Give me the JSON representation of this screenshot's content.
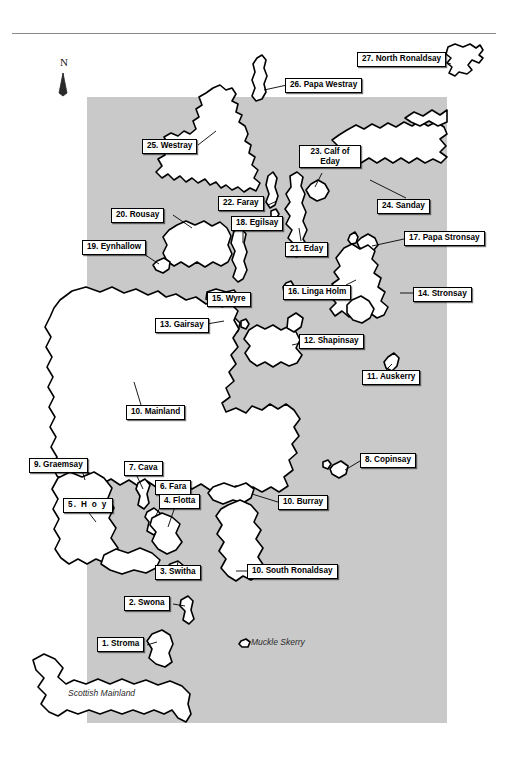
{
  "figure": {
    "kind": "reference-map",
    "title_rule": "horizontal-rule",
    "region": "Orkney Islands, Scotland"
  },
  "compass": {
    "letter": "N",
    "icon": "north-arrow-icon"
  },
  "sea": {
    "fill": "#c9c9c9",
    "land_fill": "#ffffff",
    "outline": "#000000"
  },
  "unlabelled_text": {
    "scottish_mainland": "Scottish Mainland",
    "muckle_skerry": "Muckle Skerry"
  },
  "labels": [
    {
      "id": 1,
      "text": "1. Stroma"
    },
    {
      "id": 2,
      "text": "2. Swona"
    },
    {
      "id": 3,
      "text": "3. Switha"
    },
    {
      "id": 4,
      "text": "4. Flotta"
    },
    {
      "id": 5,
      "text": "5. H o y"
    },
    {
      "id": 6,
      "text": "6. Fara"
    },
    {
      "id": 7,
      "text": "7. Cava"
    },
    {
      "id": 8,
      "text": "8. Copinsay"
    },
    {
      "id": 9,
      "text": "9. Graemsay"
    },
    {
      "id": 10,
      "text": "10. Mainland"
    },
    {
      "id": 11,
      "text": "10. Burray"
    },
    {
      "id": 12,
      "text": "10. South Ronaldsay"
    },
    {
      "id": 13,
      "text": "11. Auskerry"
    },
    {
      "id": 14,
      "text": "12. Shapinsay"
    },
    {
      "id": 15,
      "text": "13. Gairsay"
    },
    {
      "id": 16,
      "text": "14. Stronsay"
    },
    {
      "id": 17,
      "text": "15. Wyre"
    },
    {
      "id": 18,
      "text": "16. Linga Holm"
    },
    {
      "id": 19,
      "text": "17. Papa Stronsay"
    },
    {
      "id": 20,
      "text": "18. Egilsay"
    },
    {
      "id": 21,
      "text": "19. Eynhallow"
    },
    {
      "id": 22,
      "text": "20. Rousay"
    },
    {
      "id": 23,
      "text": "21. Eday"
    },
    {
      "id": 24,
      "text": "22. Faray"
    },
    {
      "id": 25,
      "text": "23. Calf of Eday"
    },
    {
      "id": 26,
      "text": "24. Sanday"
    },
    {
      "id": 27,
      "text": "25. Westray"
    },
    {
      "id": 28,
      "text": "26. Papa Westray"
    },
    {
      "id": 29,
      "text": "27. North Ronaldsay"
    }
  ],
  "callouts": {
    "stroma": "1. Stroma",
    "swona": "2. Swona",
    "switha": "3. Switha",
    "flotta": "4. Flotta",
    "hoy": "5. H o y",
    "fara": "6. Fara",
    "cava": "7. Cava",
    "copinsay": "8. Copinsay",
    "graemsay": "9. Graemsay",
    "mainland": "10. Mainland",
    "burray": "10. Burray",
    "south_ronaldsay": "10. South Ronaldsay",
    "auskerry": "11. Auskerry",
    "shapinsay": "12. Shapinsay",
    "gairsay": "13. Gairsay",
    "stronsay": "14. Stronsay",
    "wyre": "15. Wyre",
    "linga_holm": "16. Linga Holm",
    "papa_stronsay": "17. Papa Stronsay",
    "egilsay": "18. Egilsay",
    "eynhallow": "19. Eynhallow",
    "rousay": "20. Rousay",
    "eday": "21. Eday",
    "faray": "22. Faray",
    "calf_of_eday_line1": "23. Calf of",
    "calf_of_eday_line2": "Eday",
    "sanday": "24. Sanday",
    "westray": "25. Westray",
    "papa_westray": "26. Papa Westray",
    "north_ronaldsay": "27. North Ronaldsay"
  }
}
